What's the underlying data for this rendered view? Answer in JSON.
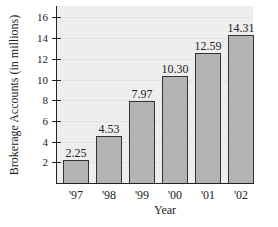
{
  "chart_data": {
    "type": "bar",
    "title": "",
    "xlabel": "Year",
    "ylabel": "Brokerage Accounts (in millions)",
    "categories": [
      "'97",
      "'98",
      "'99",
      "'00",
      "'01",
      "'02"
    ],
    "values": [
      2.25,
      4.53,
      7.97,
      10.3,
      12.59,
      14.31
    ],
    "value_labels": [
      "2.25",
      "4.53",
      "7.97",
      "10.30",
      "12.59",
      "14.31"
    ],
    "yticks": [
      "2",
      "4",
      "6",
      "8",
      "10",
      "12",
      "14",
      "16"
    ],
    "ylim": [
      0,
      16.8
    ],
    "grid": true,
    "legend": null,
    "colors": {
      "bar": "#b4b4b4",
      "bar_border": "#333333",
      "plot_background": "#eeeeee"
    }
  }
}
